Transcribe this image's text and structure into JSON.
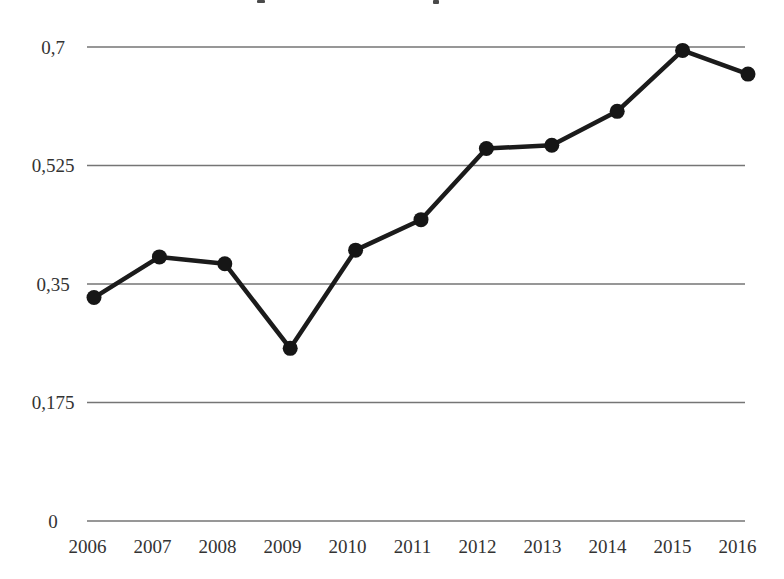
{
  "figure": {
    "background_color": "#ffffff",
    "text_color": "#333333",
    "gridline_color": "#757575",
    "line_color": "#1b1b1b",
    "marker_color": "#161616"
  },
  "chart_data": {
    "type": "line",
    "title": "",
    "categories": [
      "2006",
      "2007",
      "2008",
      "2009",
      "2010",
      "2011",
      "2012",
      "2013",
      "2014",
      "2015",
      "2016"
    ],
    "values": [
      0.33,
      0.39,
      0.38,
      0.255,
      0.4,
      0.445,
      0.55,
      0.555,
      0.605,
      0.695,
      0.66
    ],
    "xlabel": "",
    "ylabel": "",
    "ylim": [
      0,
      0.7
    ],
    "ytick_values": [
      0,
      0.175,
      0.35,
      0.525,
      0.7
    ],
    "ytick_labels": [
      "0",
      "0,175",
      "0,35",
      "0,525",
      "0,7"
    ],
    "decimal_separator": ",",
    "grid": "horizontal",
    "legend_position": "none",
    "marker": "filled-circle",
    "series_count": 1
  }
}
